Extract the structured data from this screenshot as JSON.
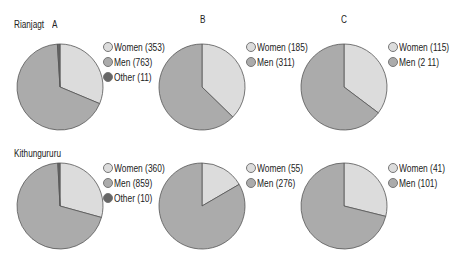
{
  "colors": {
    "women": "#dcdcdc",
    "men": "#ababab",
    "other": "#666666",
    "stroke": "#555555"
  },
  "labels": {
    "row1": "Rianjagt",
    "row2": "Kithungururu",
    "colA": "A",
    "colB": "B",
    "colC": "C"
  },
  "chart_data": [
    {
      "type": "pie",
      "title": "Rianjagt A",
      "categories": [
        "Women",
        "Men",
        "Other"
      ],
      "values": [
        353,
        763,
        11
      ],
      "legend": [
        "Women (353)",
        "Men (763)",
        "Other (11)"
      ]
    },
    {
      "type": "pie",
      "title": "Rianjagt B",
      "categories": [
        "Women",
        "Men"
      ],
      "values": [
        185,
        311
      ],
      "legend": [
        "Women (185)",
        "Men (311)"
      ]
    },
    {
      "type": "pie",
      "title": "Rianjagt C",
      "categories": [
        "Women",
        "Men"
      ],
      "values": [
        115,
        211
      ],
      "legend": [
        "Women (115)",
        "Men (2 11)"
      ]
    },
    {
      "type": "pie",
      "title": "Kithungururu A",
      "categories": [
        "Women",
        "Men",
        "Other"
      ],
      "values": [
        360,
        859,
        10
      ],
      "legend": [
        "Women (360)",
        "Men (859)",
        "Other (10)"
      ]
    },
    {
      "type": "pie",
      "title": "Kithungururu B",
      "categories": [
        "Women",
        "Men"
      ],
      "values": [
        55,
        276
      ],
      "legend": [
        "Women (55)",
        "Men (276)"
      ]
    },
    {
      "type": "pie",
      "title": "Kithungururu C",
      "categories": [
        "Women",
        "Men"
      ],
      "values": [
        41,
        101
      ],
      "legend": [
        "Women (41)",
        "Men (101)"
      ]
    }
  ]
}
